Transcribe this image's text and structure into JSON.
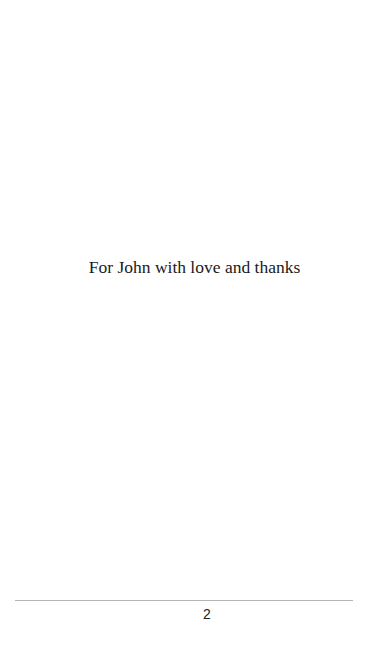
{
  "page": {
    "dedication": "For John with love and thanks",
    "footer": {
      "page_number": "2"
    }
  }
}
